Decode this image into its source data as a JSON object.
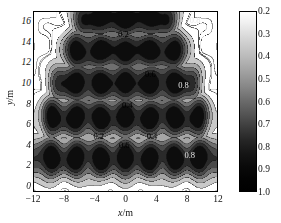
{
  "figure": {
    "type": "contour-map",
    "background": "#ffffff"
  },
  "axes": {
    "xlabel_var": "x",
    "xlabel_unit": "/m",
    "ylabel_var": "y",
    "ylabel_unit": "/m",
    "xticks": [
      "-12",
      "-8",
      "-4",
      "0",
      "4",
      "8",
      "12"
    ],
    "yticks": [
      "16",
      "14",
      "12",
      "10",
      "8",
      "6",
      "4",
      "2",
      "0"
    ],
    "xlim": [
      -12,
      12
    ],
    "ylim": [
      -0.6,
      17.0
    ]
  },
  "colorbar": {
    "ticks": [
      "0.2",
      "0.3",
      "0.4",
      "0.5",
      "0.6",
      "0.7",
      "0.8",
      "0.9",
      "1.0"
    ],
    "vmin_label": "0.2",
    "vmax_label": "1.0",
    "orientation": "vertical",
    "top_color": "#ffffff",
    "bottom_color": "#000000"
  },
  "contour_labels": [
    {
      "text": "0.8",
      "x": 8.9,
      "y": 16.2,
      "style": "dark"
    },
    {
      "text": "0.2",
      "x": -0.4,
      "y": 14.9,
      "style": "light"
    },
    {
      "text": "0.6",
      "x": 3.1,
      "y": 11.0,
      "style": "light"
    },
    {
      "text": "0.8",
      "x": 7.4,
      "y": 9.9,
      "style": "dark"
    },
    {
      "text": "0.4",
      "x": 0.1,
      "y": 8.0,
      "style": "light"
    },
    {
      "text": "0.2",
      "x": -3.6,
      "y": 4.9,
      "style": "light"
    },
    {
      "text": "0.4",
      "x": 3.3,
      "y": 4.9,
      "style": "light"
    },
    {
      "text": "0.6",
      "x": -0.3,
      "y": 4.1,
      "style": "light"
    },
    {
      "text": "0.8",
      "x": 8.2,
      "y": 3.1,
      "style": "dark"
    }
  ],
  "chart_data": {
    "type": "heatmap",
    "title": "",
    "xlabel": "x/m",
    "ylabel": "y/m",
    "xlim": [
      -12,
      12
    ],
    "ylim": [
      -0.6,
      17
    ],
    "zlim": [
      0.2,
      1.0
    ],
    "colormap": "gray-reversed",
    "contour_levels": [
      0.2,
      0.3,
      0.4,
      0.5,
      0.6,
      0.7,
      0.8,
      0.9,
      1.0
    ],
    "band_centers_y": [
      2.6,
      6.6,
      10.0,
      13.2,
      16.4
    ],
    "node_lines_y": [
      0.8,
      4.8,
      8.1,
      11.9,
      15.0
    ],
    "lobe_half_width_x": [
      11.0,
      9.5,
      8.0,
      6.5,
      5.0
    ],
    "peak_value": 1.0,
    "node_value": 0.2
  }
}
